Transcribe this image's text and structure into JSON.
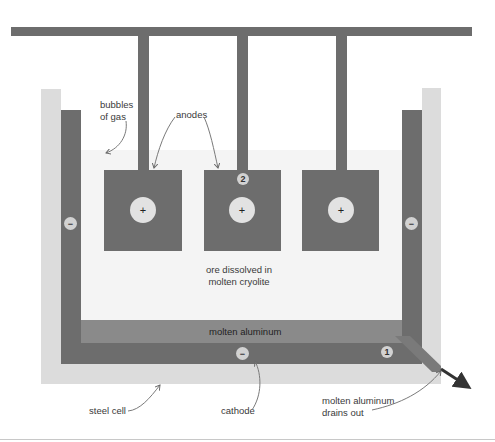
{
  "diagram": {
    "labels": {
      "bubbles": [
        "bubbles",
        "of gas"
      ],
      "anodes": "anodes",
      "ore": [
        "ore dissolved in",
        "molten cryolite"
      ],
      "molten_aluminum": "molten aluminum",
      "steel_cell": "steel cell",
      "cathode": "cathode",
      "drains": [
        "molten aluminum",
        "drains out"
      ]
    },
    "symbols": {
      "anode_sign": "+",
      "cathode_sign": "−"
    },
    "step_badges": [
      "1",
      "2"
    ],
    "colors": {
      "electrode": "#6d6d6d",
      "steel_cell": "#dcdcdc",
      "electrolyte": "#f4f4f4",
      "aluminum_layer": "#8a8a8a",
      "arrow": "#333333"
    }
  }
}
